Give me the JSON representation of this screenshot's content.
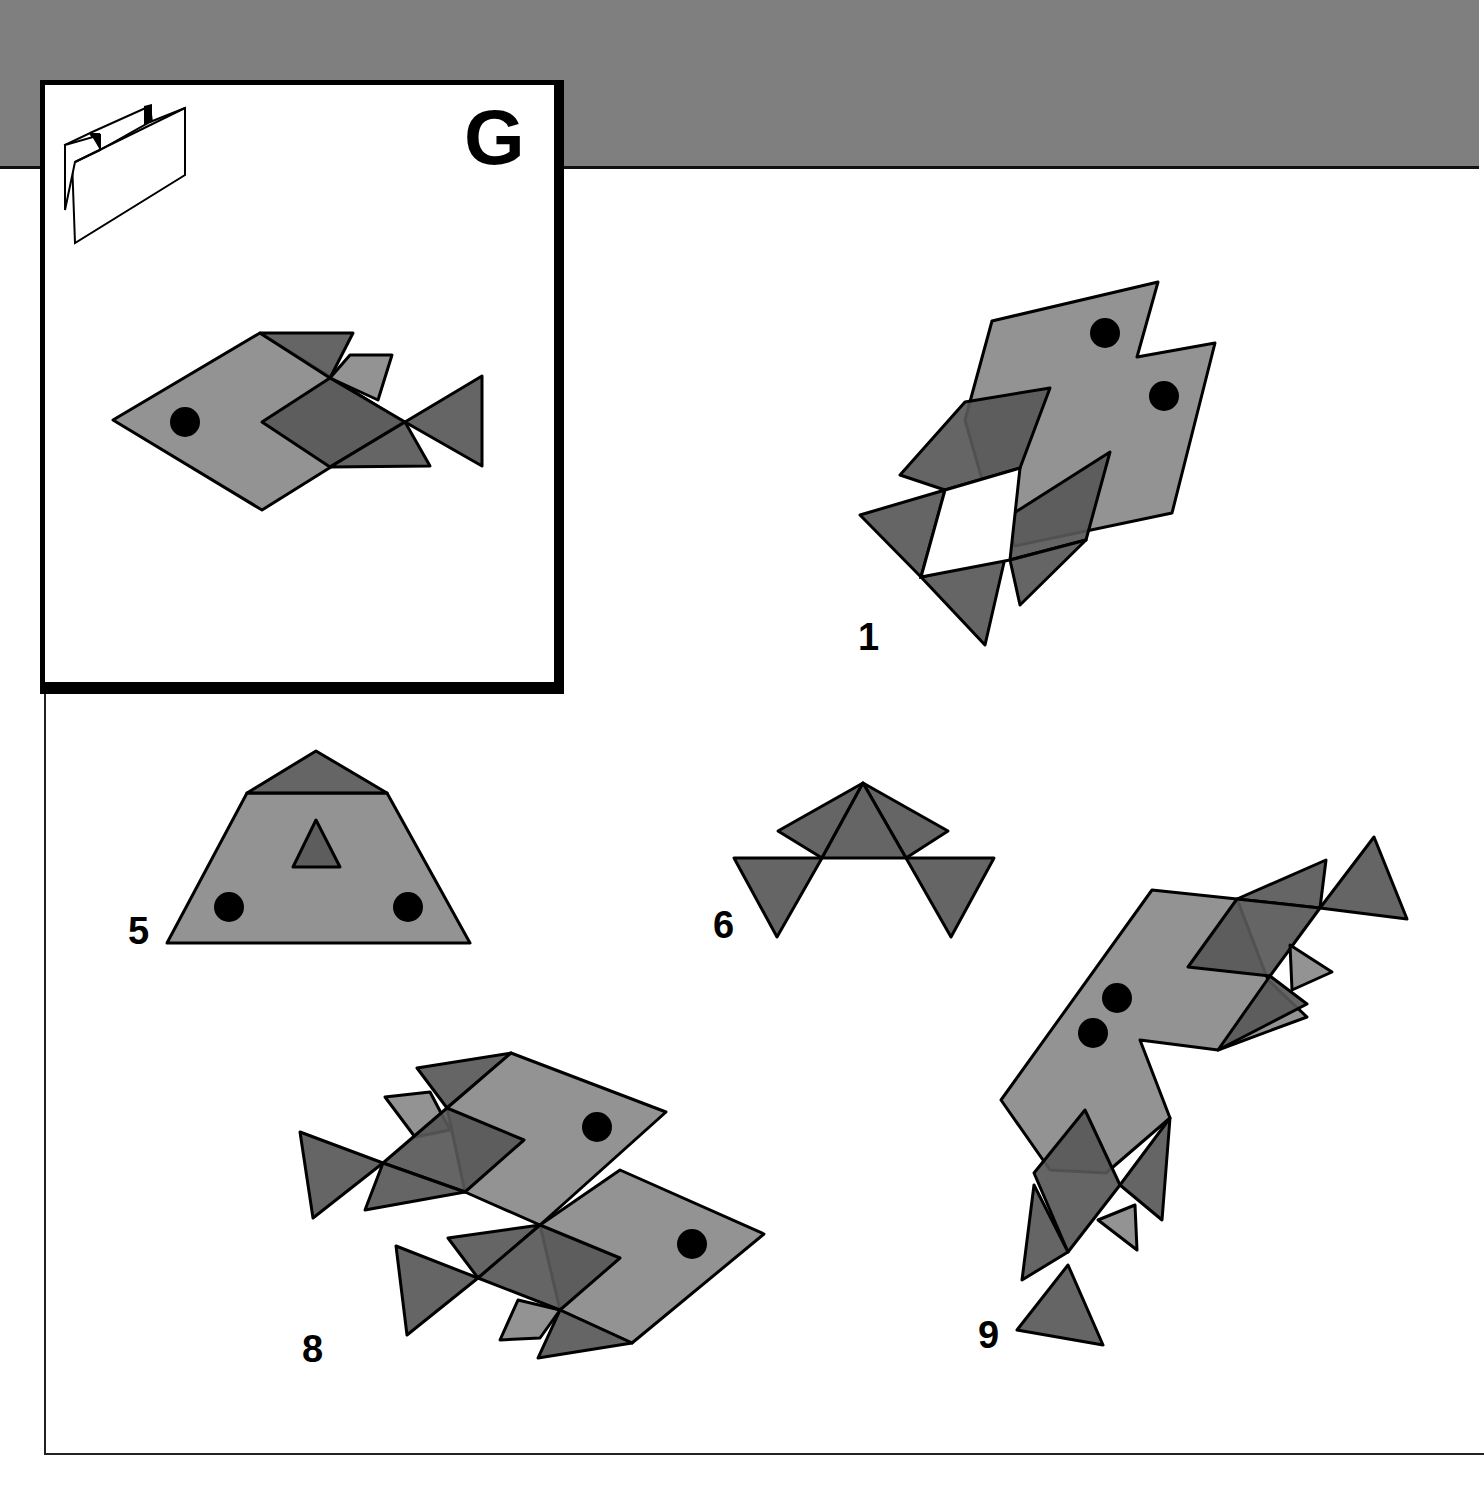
{
  "page": {
    "band_color": "#7f7f7f",
    "light_fill": "#8a8a8a",
    "dark_fill": "#585858",
    "stroke": "#000000"
  },
  "legend": {
    "letter": "G",
    "icon": "folded-paper-icon"
  },
  "figures": [
    {
      "id": "model",
      "label": "",
      "shapes": [
        {
          "fill": "light",
          "points": "113,420 260,333 403,422 262,510"
        },
        {
          "fill": "dark",
          "points": "260,333 353,333 330,378"
        },
        {
          "fill": "light",
          "points": "330,378 350,355 392,355 378,400"
        },
        {
          "fill": "dark",
          "points": "262,422 330,378 405,422 330,467"
        },
        {
          "fill": "dark",
          "points": "330,467 405,422 430,466"
        },
        {
          "fill": "dark",
          "points": "405,422 482,376 482,466"
        }
      ],
      "dots": [
        {
          "cx": 185,
          "cy": 422,
          "r": 15
        }
      ]
    },
    {
      "id": "fig-1",
      "label": "1",
      "label_pos": [
        858,
        618
      ],
      "shapes": [
        {
          "fill": "light",
          "points": "992,321 1158,282 1137,357 1215,343 1172,513 1015,546 985,490 965,420"
        },
        {
          "fill": "dark",
          "points": "900,475 965,402 1050,388 1020,468 945,490"
        },
        {
          "fill": "dark",
          "points": "1003,520 1110,452 1086,540 1010,560"
        },
        {
          "fill": "dark",
          "points": "860,515 945,490 921,577"
        },
        {
          "fill": "dark",
          "points": "921,577 1005,558 985,645"
        },
        {
          "fill": "dark",
          "points": "1010,560 1086,540 1020,605"
        }
      ],
      "holes": [
        {
          "points": "945,490 1020,468 1010,560 921,577"
        }
      ],
      "dots": [
        {
          "cx": 1105,
          "cy": 333,
          "r": 15
        },
        {
          "cx": 1164,
          "cy": 396,
          "r": 15
        }
      ]
    },
    {
      "id": "fig-5",
      "label": "5",
      "label_pos": [
        128,
        912
      ],
      "shapes": [
        {
          "fill": "light",
          "points": "247,793 387,793 470,943 167,943"
        },
        {
          "fill": "dark",
          "points": "247,793 316,751 387,793"
        },
        {
          "fill": "dark",
          "points": "316,820 340,867 293,867"
        }
      ],
      "dots": [
        {
          "cx": 229,
          "cy": 907,
          "r": 15
        },
        {
          "cx": 408,
          "cy": 907,
          "r": 15
        }
      ]
    },
    {
      "id": "fig-6",
      "label": "6",
      "label_pos": [
        713,
        906
      ],
      "shapes": [
        {
          "fill": "dark",
          "points": "863,783 778,831 822,858"
        },
        {
          "fill": "dark",
          "points": "863,783 948,831 906,858"
        },
        {
          "fill": "dark",
          "points": "863,783 906,858 822,858"
        },
        {
          "fill": "dark",
          "points": "734,858 822,858 777,937"
        },
        {
          "fill": "dark",
          "points": "906,858 994,858 951,937"
        }
      ],
      "dots": []
    },
    {
      "id": "fig-8",
      "label": "8",
      "label_pos": [
        302,
        1330
      ],
      "shapes": [
        {
          "fill": "light",
          "points": "385,1097 430,1092 450,1130 415,1137"
        },
        {
          "fill": "dark",
          "points": "417,1068 511,1053 447,1108"
        },
        {
          "fill": "light",
          "points": "447,1108 511,1053 666,1112 540,1225 465,1192"
        },
        {
          "fill": "dark",
          "points": "383,1163 447,1108 524,1140 465,1192"
        },
        {
          "fill": "dark",
          "points": "300,1132 383,1163 313,1218"
        },
        {
          "fill": "dark",
          "points": "383,1163 465,1192 365,1210"
        },
        {
          "fill": "light",
          "points": "540,1225 620,1170 764,1234 632,1343 560,1310"
        },
        {
          "fill": "dark",
          "points": "448,1238 540,1225 478,1278"
        },
        {
          "fill": "dark",
          "points": "478,1278 540,1225 620,1258 560,1310"
        },
        {
          "fill": "dark",
          "points": "396,1246 478,1278 407,1335"
        },
        {
          "fill": "light",
          "points": "500,1340 518,1300 560,1310 540,1338"
        },
        {
          "fill": "dark",
          "points": "560,1310 632,1343 538,1358"
        }
      ],
      "dots": [
        {
          "cx": 597,
          "cy": 1127,
          "r": 15
        },
        {
          "cx": 692,
          "cy": 1244,
          "r": 15
        }
      ]
    },
    {
      "id": "fig-9",
      "label": "9",
      "label_pos": [
        978,
        1316
      ],
      "shapes": [
        {
          "fill": "light",
          "points": "1152,890 1237,899 1268,980 1307,1017 1218,1050 1140,1040 1170,1118 1106,1173 1050,1170 1001,1100"
        },
        {
          "fill": "dark",
          "points": "1237,899 1326,860 1320,908"
        },
        {
          "fill": "dark",
          "points": "1320,908 1374,837 1407,919"
        },
        {
          "fill": "dark",
          "points": "1188,967 1237,899 1320,908 1270,976"
        },
        {
          "fill": "light",
          "points": "1290,945 1332,972 1292,990"
        },
        {
          "fill": "dark",
          "points": "1270,976 1307,1004 1218,1050"
        },
        {
          "fill": "dark",
          "points": "1034,1173 1085,1110 1120,1185 1068,1252"
        },
        {
          "fill": "dark",
          "points": "1120,1185 1170,1118 1162,1220"
        },
        {
          "fill": "dark",
          "points": "1034,1185 1068,1252 1022,1280"
        },
        {
          "fill": "light",
          "points": "1098,1220 1135,1205 1137,1250"
        },
        {
          "fill": "dark",
          "points": "1068,1265 1103,1345 1017,1330"
        }
      ],
      "dots": [
        {
          "cx": 1117,
          "cy": 998,
          "r": 15
        },
        {
          "cx": 1093,
          "cy": 1033,
          "r": 15
        }
      ]
    }
  ]
}
